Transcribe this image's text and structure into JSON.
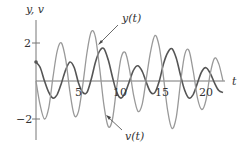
{
  "chart_data": {
    "type": "line",
    "title": "",
    "xlabel": "t",
    "ylabel": "y, v",
    "xlim": [
      0,
      22
    ],
    "ylim": [
      -2.6,
      2.6
    ],
    "x_ticks": [
      5,
      10,
      15,
      20
    ],
    "x_tick_labels": [
      "5",
      "10",
      "15",
      "20"
    ],
    "y_ticks": [
      2,
      -2
    ],
    "y_tick_labels": [
      "2",
      "−2"
    ],
    "grid": false,
    "legend": "annotations with arrows",
    "annotations": [
      {
        "text": "y(t)",
        "target_series": "y(t)"
      },
      {
        "text": "v(t)",
        "target_series": "v(t)"
      }
    ],
    "x": [
      0,
      0.5,
      1,
      1.5,
      2,
      2.5,
      3,
      3.5,
      4,
      4.5,
      5,
      5.5,
      6,
      6.5,
      7,
      7.5,
      8,
      8.5,
      9,
      9.5,
      10,
      10.5,
      11,
      11.5,
      12,
      12.5,
      13,
      13.5,
      14,
      14.5,
      15,
      15.5,
      16,
      16.5,
      17,
      17.5,
      18,
      18.5,
      19,
      19.5,
      20,
      20.5,
      21,
      21.5,
      22
    ],
    "series": [
      {
        "name": "y(t)",
        "color": "#555555",
        "values": [
          1.0,
          0.7,
          0.0,
          -0.6,
          -0.9,
          -0.7,
          -0.1,
          0.6,
          1.0,
          0.7,
          -0.1,
          -0.6,
          -0.6,
          0.1,
          1.0,
          1.6,
          1.7,
          1.1,
          0.2,
          -0.6,
          -0.9,
          -0.6,
          0.0,
          0.6,
          0.8,
          0.5,
          -0.1,
          -0.6,
          -0.6,
          0.0,
          0.9,
          1.5,
          1.7,
          1.2,
          0.3,
          -0.5,
          -0.9,
          -0.7,
          -0.1,
          0.5,
          0.7,
          0.4,
          -0.1,
          -0.5,
          -0.6
        ]
      },
      {
        "name": "v(t)",
        "color": "#999999",
        "values": [
          0.0,
          -1.3,
          -2.0,
          -1.4,
          0.2,
          1.6,
          2.0,
          1.1,
          -0.6,
          -1.8,
          -1.6,
          -0.2,
          1.5,
          2.6,
          2.3,
          0.6,
          -1.3,
          -2.4,
          -2.0,
          -0.3,
          1.2,
          1.5,
          0.6,
          -0.8,
          -1.6,
          -1.2,
          0.2,
          1.6,
          2.4,
          1.8,
          0.2,
          -1.6,
          -2.5,
          -1.9,
          -0.1,
          1.4,
          1.6,
          0.5,
          -0.9,
          -1.5,
          -1.0,
          0.4,
          1.2,
          0.9,
          0.0
        ]
      }
    ]
  },
  "labels": {
    "axis_y": "y, v",
    "axis_x": "t",
    "y_annot": "y(t)",
    "v_annot": "v(t)",
    "tick_2": "2",
    "tick_m2": "−2",
    "tick_5": "5",
    "tick_10": "10",
    "tick_15": "15",
    "tick_20": "20"
  }
}
